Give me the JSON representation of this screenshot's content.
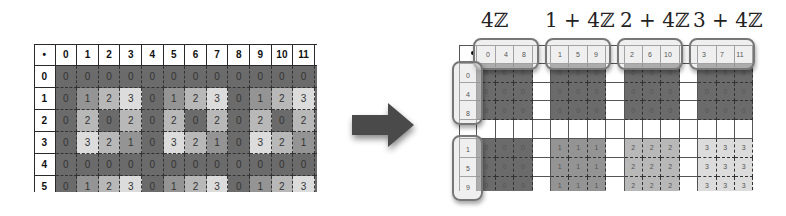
{
  "left_table": {
    "corner_symbol": "•",
    "column_headers": [
      "0",
      "1",
      "2",
      "3",
      "4",
      "5",
      "6",
      "7",
      "8",
      "9",
      "10",
      "11"
    ],
    "row_headers": [
      "0",
      "1",
      "2",
      "3",
      "4",
      "5"
    ],
    "rows": [
      [
        "0",
        "0",
        "0",
        "0",
        "0",
        "0",
        "0",
        "0",
        "0",
        "0",
        "0",
        "0"
      ],
      [
        "0",
        "1",
        "2",
        "3",
        "0",
        "1",
        "2",
        "3",
        "0",
        "1",
        "2",
        "3"
      ],
      [
        "0",
        "2",
        "0",
        "2",
        "0",
        "2",
        "0",
        "2",
        "0",
        "2",
        "0",
        "2"
      ],
      [
        "0",
        "3",
        "2",
        "1",
        "0",
        "3",
        "2",
        "1",
        "0",
        "3",
        "2",
        "1"
      ],
      [
        "0",
        "0",
        "0",
        "0",
        "0",
        "0",
        "0",
        "0",
        "0",
        "0",
        "0",
        "0"
      ],
      [
        "0",
        "1",
        "2",
        "3",
        "0",
        "1",
        "2",
        "3",
        "0",
        "1",
        "2",
        "3"
      ]
    ]
  },
  "value_colors": {
    "0": "#6b6b6b",
    "1": "#949494",
    "2": "#b8b8b8",
    "3": "#dcdcdc"
  },
  "arrow": {
    "icon": "right-arrow-icon",
    "color": "#4a4a4a"
  },
  "right_table": {
    "corner_symbol": "•",
    "coset_titles": [
      "4ℤ",
      "1 + 4ℤ",
      "2 + 4ℤ",
      "3 + 4ℤ"
    ],
    "column_groups": [
      {
        "headers": [
          "0",
          "4",
          "8"
        ]
      },
      {
        "headers": [
          "1",
          "5",
          "9"
        ]
      },
      {
        "headers": [
          "2",
          "6",
          "10"
        ]
      },
      {
        "headers": [
          "3",
          "7",
          "11"
        ]
      }
    ],
    "row_groups": [
      {
        "headers": [
          "0",
          "4",
          "8"
        ],
        "values": [
          "0",
          "0",
          "0",
          "0"
        ]
      },
      {
        "headers": [
          "1",
          "5",
          "9"
        ],
        "values": [
          "0",
          "1",
          "2",
          "3"
        ]
      }
    ]
  }
}
